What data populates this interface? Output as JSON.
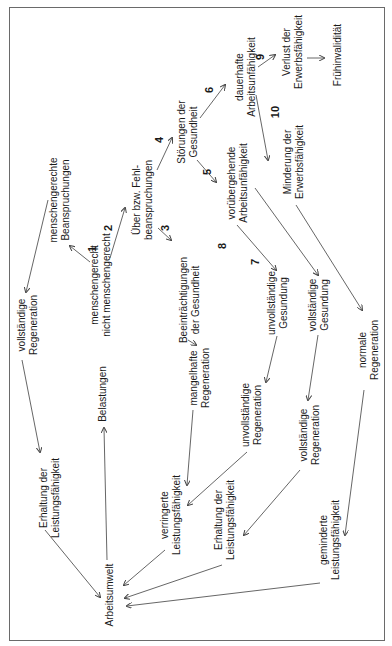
{
  "diagram": {
    "orientation": "rotated 90 degrees counter-clockwise",
    "line_color": "#555555",
    "nodes": {
      "arbeitsumwelt": {
        "lines": [
          "Arbeitsumwelt"
        ]
      },
      "belastungen": {
        "lines": [
          "Belastungen"
        ]
      },
      "belastungsart": {
        "lines": [
          "menschengerecht",
          "nicht menschengerecht"
        ]
      },
      "menschengerechte_beanspruchungen": {
        "lines": [
          "menschengerechte",
          "Beanspruchungen"
        ]
      },
      "vollstaendige_regeneration_1": {
        "lines": [
          "vollständige",
          "Regeneration"
        ]
      },
      "erhaltung_1": {
        "lines": [
          "Erhaltung der",
          "Leistungsfähigkeit"
        ]
      },
      "ueber_fehlbeanspruchungen": {
        "lines": [
          "Über bzw. Fehl-",
          "beanspruchungen"
        ]
      },
      "beeintraechtigungen": {
        "lines": [
          "Beeinträchtigungen",
          "der Gesundheit"
        ]
      },
      "mangelhafte_regeneration": {
        "lines": [
          "mangelhafte",
          "Regeneration"
        ]
      },
      "verringerte_leistung": {
        "lines": [
          "verringerte",
          "Leistungsfähigkeit"
        ]
      },
      "stoerungen": {
        "lines": [
          "Störungen der",
          "Gesundheit"
        ]
      },
      "voruebergehende_au": {
        "lines": [
          "vorübergehende",
          "Arbeitsunfähigkeit"
        ]
      },
      "unvollstaendige_gesundung": {
        "lines": [
          "unvollständige",
          "Gesundung"
        ]
      },
      "unvollstaendige_regeneration": {
        "lines": [
          "unvollständige",
          "Regeneration"
        ]
      },
      "erhaltung_2": {
        "lines": [
          "Erhaltung der",
          "Leistungsfähigkeit"
        ]
      },
      "vollstaendige_gesundung": {
        "lines": [
          "vollständige",
          "Gesundung"
        ]
      },
      "vollstaendige_regeneration_2": {
        "lines": [
          "vollständige",
          "Regeneration"
        ]
      },
      "dauerhafte_au": {
        "lines": [
          "dauerhafte",
          "Arbeitsunfähigkeit"
        ]
      },
      "verlust_ef": {
        "lines": [
          "Verlust der",
          "Erwerbsfähigkeit"
        ]
      },
      "fruehinvaliditaet": {
        "lines": [
          "Frühinvalidität"
        ]
      },
      "minderung_ef": {
        "lines": [
          "Minderung der",
          "Erwerbsfähigkeit"
        ]
      },
      "normale_regeneration": {
        "lines": [
          "normale",
          "Regeneration"
        ]
      },
      "geminderte_leistung": {
        "lines": [
          "geminderte",
          "Leistungsfähigkeit"
        ]
      }
    },
    "path_numbers": [
      "1",
      "2",
      "3",
      "4",
      "5",
      "6",
      "7",
      "8",
      "9",
      "10"
    ]
  }
}
